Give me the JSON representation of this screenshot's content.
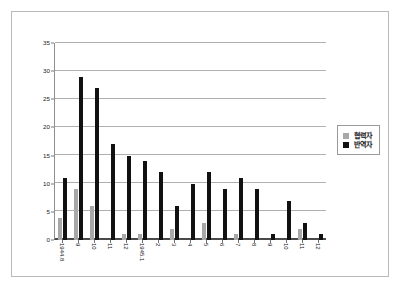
{
  "chart_data": {
    "type": "bar",
    "title": "",
    "xlabel": "",
    "ylabel": "",
    "ylim": [
      0,
      35
    ],
    "ytick_step": 5,
    "yticks": [
      "0",
      "5",
      "10",
      "15",
      "20",
      "25",
      "30",
      "35"
    ],
    "grid": true,
    "legend_position": "right",
    "categories": [
      "1944.8",
      "9",
      "10",
      "11",
      "12",
      "1945.1",
      "2",
      "3",
      "4",
      "5",
      "6",
      "7",
      "8",
      "9",
      "10",
      "11",
      "12"
    ],
    "series": [
      {
        "name": "협력자",
        "color": "#a8a8a8",
        "values": [
          4,
          9,
          6,
          0,
          1,
          1,
          0,
          2,
          0,
          3,
          0,
          1,
          0,
          0,
          0,
          2,
          0
        ]
      },
      {
        "name": "반역자",
        "color": "#111111",
        "values": [
          11,
          29,
          27,
          17,
          15,
          14,
          12,
          6,
          10,
          12,
          9,
          11,
          9,
          1,
          7,
          3,
          1
        ]
      }
    ]
  },
  "legend": {
    "items": [
      {
        "label": "협력자",
        "swatch": "gray-swatch"
      },
      {
        "label": "반역자",
        "swatch": "black-swatch"
      }
    ]
  }
}
